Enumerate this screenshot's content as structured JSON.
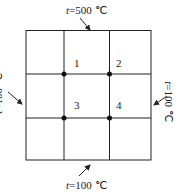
{
  "diagram": {
    "type": "grid-heat-conduction",
    "boundaries": {
      "top": {
        "var": "t",
        "value": "=500 ℃"
      },
      "left": {
        "var": "t",
        "value": "=100 ℃"
      },
      "right": {
        "var": "t",
        "value": "=100 ℃"
      },
      "bottom": {
        "var": "t",
        "value": "=100 ℃"
      }
    },
    "nodes": [
      {
        "label": "1"
      },
      {
        "label": "2"
      },
      {
        "label": "3"
      },
      {
        "label": "4"
      }
    ],
    "colors": {
      "line": "#222222",
      "background": "#ffffff"
    }
  }
}
